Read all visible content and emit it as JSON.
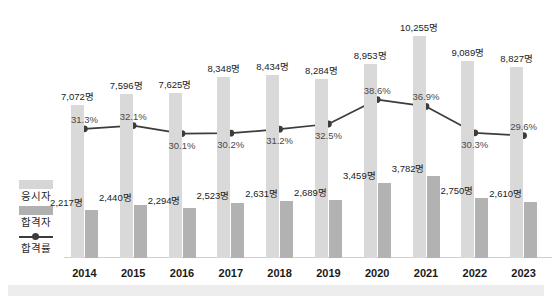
{
  "legend": {
    "items": [
      {
        "key": "examinees",
        "label": "응시자",
        "swatch": "light-gray-bar",
        "color": "#d9d9d9"
      },
      {
        "key": "passers",
        "label": "합격자",
        "swatch": "dark-gray-bar",
        "color": "#b2b2b2"
      },
      {
        "key": "rate",
        "label": "합격률",
        "swatch": "line-with-marker",
        "color": "#3c3c3c"
      }
    ]
  },
  "chart_data": {
    "type": "bar",
    "title": "",
    "subtitle": "",
    "xlabel": "",
    "ylabel": "",
    "grid": false,
    "legend_position": "left",
    "categories": [
      "2014",
      "2015",
      "2016",
      "2017",
      "2018",
      "2019",
      "2020",
      "2021",
      "2022",
      "2023"
    ],
    "ylim": [
      0,
      11000
    ],
    "rate_ylim": [
      0,
      100
    ],
    "series": [
      {
        "name": "응시자",
        "type": "bar",
        "color": "#d9d9d9",
        "values": [
          7072,
          7596,
          7625,
          8348,
          8434,
          8284,
          8953,
          10255,
          9089,
          8827
        ],
        "labels": [
          "7,072명",
          "7,596명",
          "7,625명",
          "8,348명",
          "8,434명",
          "8,284명",
          "8,953명",
          "10,255명",
          "9,089명",
          "8,827명"
        ]
      },
      {
        "name": "합격자",
        "type": "bar",
        "color": "#b2b2b2",
        "values": [
          2217,
          2440,
          2294,
          2523,
          2631,
          2689,
          3459,
          3782,
          2750,
          2610
        ],
        "labels": [
          "2,217명",
          "2,440명",
          "2,294명",
          "2,523명",
          "2,631명",
          "2,689명",
          "3,459명",
          "3,782명",
          "2,750명",
          "2,610명"
        ]
      },
      {
        "name": "합격률",
        "type": "line",
        "color": "#3c3c3c",
        "values": [
          31.3,
          32.1,
          30.1,
          30.2,
          31.2,
          32.5,
          38.6,
          36.9,
          30.3,
          29.6
        ],
        "labels": [
          "31.3%",
          "32.1%",
          "30.1%",
          "30.2%",
          "31.2%",
          "32.5%",
          "38.6%",
          "36.9%",
          "30.3%",
          "29.6%"
        ]
      }
    ]
  }
}
